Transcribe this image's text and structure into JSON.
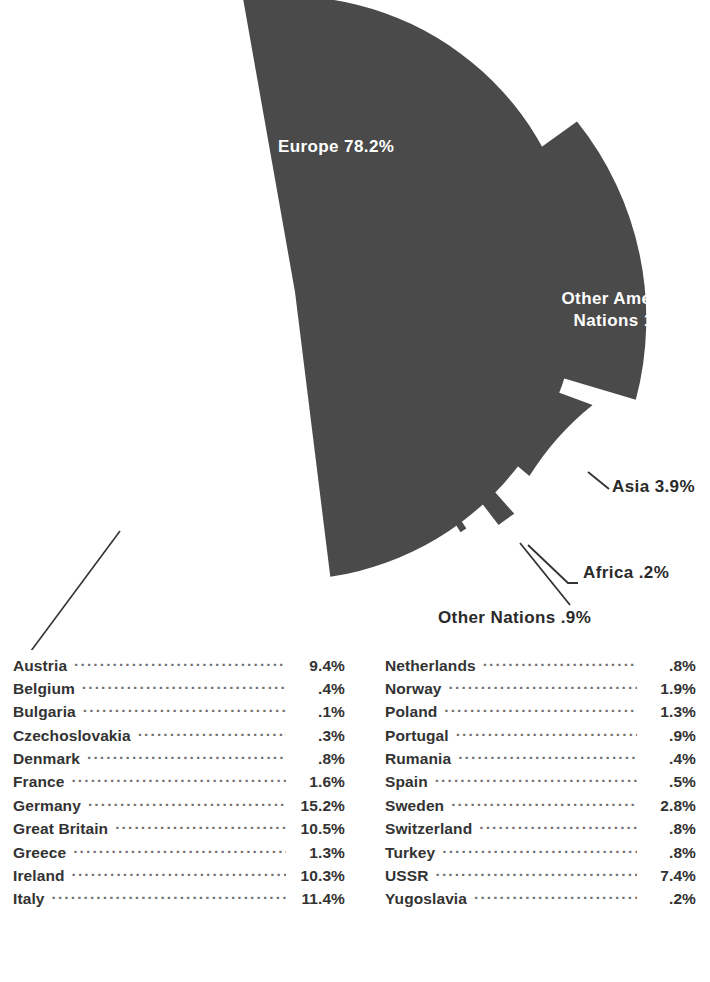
{
  "chart_data": {
    "type": "pie",
    "title": "",
    "subtitle": "",
    "xlabel": "",
    "ylabel": "",
    "legend_position": "none",
    "grid": false,
    "units": "percent",
    "categories": [
      "Europe",
      "Other American Nations",
      "Asia",
      "Africa",
      "Other Nations"
    ],
    "values": [
      78.2,
      16.8,
      3.9,
      0.2,
      0.9
    ],
    "labels": [
      "Europe 78.2%",
      "Other American Nations 16.8%",
      "Asia 3.9%",
      "Africa .2%",
      "Other Nations .9%"
    ],
    "slice_color": "#4a4a4a",
    "background_color": "#ffffff",
    "exploded": [
      "Other American Nations",
      "Asia",
      "Africa",
      "Other Nations"
    ],
    "breakdown_title": "",
    "breakdown_of": "Europe",
    "breakdown": [
      {
        "name": "Austria",
        "value": "9.4%"
      },
      {
        "name": "Belgium",
        "value": ".4%"
      },
      {
        "name": "Bulgaria",
        "value": ".1%"
      },
      {
        "name": "Czechoslovakia",
        "value": ".3%"
      },
      {
        "name": "Denmark",
        "value": ".8%"
      },
      {
        "name": "France",
        "value": "1.6%"
      },
      {
        "name": "Germany",
        "value": "15.2%"
      },
      {
        "name": "Great Britain",
        "value": "10.5%"
      },
      {
        "name": "Greece",
        "value": "1.3%"
      },
      {
        "name": "Ireland",
        "value": "10.3%"
      },
      {
        "name": "Italy",
        "value": "11.4%"
      },
      {
        "name": "Netherlands",
        "value": ".8%"
      },
      {
        "name": "Norway",
        "value": "1.9%"
      },
      {
        "name": "Poland",
        "value": "1.3%"
      },
      {
        "name": "Portugal",
        "value": ".9%"
      },
      {
        "name": "Rumania",
        "value": ".4%"
      },
      {
        "name": "Spain",
        "value": ".5%"
      },
      {
        "name": "Sweden",
        "value": "2.8%"
      },
      {
        "name": "Switzerland",
        "value": ".8%"
      },
      {
        "name": "Turkey",
        "value": ".8%"
      },
      {
        "name": "USSR",
        "value": "7.4%"
      },
      {
        "name": "Yugoslavia",
        "value": ".2%"
      }
    ]
  },
  "pie": {
    "slices": {
      "europe": {
        "label": "Europe 78.2%"
      },
      "other_american": {
        "line1": "Other American",
        "line2": "Nations 16.8%"
      },
      "asia": {
        "label": "Asia 3.9%"
      },
      "africa": {
        "label": "Africa .2%"
      },
      "other_nations": {
        "label": "Other Nations .9%"
      }
    }
  },
  "table": {
    "left_column": [
      {
        "name": "Austria",
        "value": "9.4%"
      },
      {
        "name": "Belgium",
        "value": ".4%"
      },
      {
        "name": "Bulgaria",
        "value": ".1%"
      },
      {
        "name": "Czechoslovakia",
        "value": ".3%"
      },
      {
        "name": "Denmark",
        "value": ".8%"
      },
      {
        "name": "France",
        "value": "1.6%"
      },
      {
        "name": "Germany",
        "value": "15.2%"
      },
      {
        "name": "Great Britain",
        "value": "10.5%"
      },
      {
        "name": "Greece",
        "value": "1.3%"
      },
      {
        "name": "Ireland",
        "value": "10.3%"
      },
      {
        "name": "Italy",
        "value": "11.4%"
      }
    ],
    "right_column": [
      {
        "name": "Netherlands",
        "value": ".8%"
      },
      {
        "name": "Norway",
        "value": "1.9%"
      },
      {
        "name": "Poland",
        "value": "1.3%"
      },
      {
        "name": "Portugal",
        "value": ".9%"
      },
      {
        "name": "Rumania",
        "value": ".4%"
      },
      {
        "name": "Spain",
        "value": ".5%"
      },
      {
        "name": "Sweden",
        "value": "2.8%"
      },
      {
        "name": "Switzerland",
        "value": ".8%"
      },
      {
        "name": "Turkey",
        "value": ".8%"
      },
      {
        "name": "USSR",
        "value": "7.4%"
      },
      {
        "name": "Yugoslavia",
        "value": ".2%"
      }
    ]
  }
}
